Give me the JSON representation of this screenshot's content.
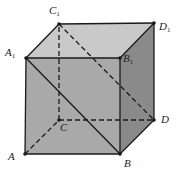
{
  "diagram": {
    "type": "cube",
    "colors": {
      "front_face": "#a9a9a9",
      "top_face": "#c9c9c9",
      "right_face": "#8a8a8a",
      "edge": "#1a1a1a"
    },
    "vertices": [
      {
        "id": "A",
        "name": "A",
        "sub": ""
      },
      {
        "id": "B",
        "name": "B",
        "sub": ""
      },
      {
        "id": "C",
        "name": "C",
        "sub": ""
      },
      {
        "id": "D",
        "name": "D",
        "sub": ""
      },
      {
        "id": "A1",
        "name": "A",
        "sub": "1"
      },
      {
        "id": "B1",
        "name": "B",
        "sub": "1"
      },
      {
        "id": "C1",
        "name": "C",
        "sub": "1"
      },
      {
        "id": "D1",
        "name": "D",
        "sub": "1"
      }
    ],
    "solid_edges": [
      [
        "A",
        "B"
      ],
      [
        "B",
        "D"
      ],
      [
        "D",
        "D1"
      ],
      [
        "D1",
        "C1"
      ],
      [
        "C1",
        "A1"
      ],
      [
        "A1",
        "A"
      ],
      [
        "A1",
        "B1"
      ],
      [
        "B1",
        "B"
      ],
      [
        "B1",
        "D1"
      ],
      [
        "A1",
        "B"
      ]
    ],
    "dashed_edges": [
      [
        "A",
        "C"
      ],
      [
        "C",
        "D"
      ],
      [
        "C",
        "C1"
      ],
      [
        "C1",
        "D"
      ]
    ]
  }
}
